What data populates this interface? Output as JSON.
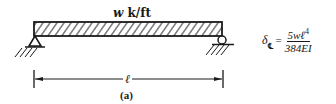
{
  "figure": {
    "load_label_symbol": "w",
    "load_label_units": "k/ft",
    "span_label": "ℓ",
    "caption": "(a)",
    "supports": {
      "left": "pin",
      "right": "roller"
    }
  },
  "formula": {
    "lhs_symbol": "δ",
    "lhs_subscript": "℄",
    "equals": "=",
    "numerator": "5wℓ",
    "numerator_exponent": "4",
    "denominator": "384EI"
  }
}
